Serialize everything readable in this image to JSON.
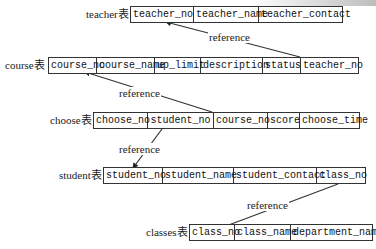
{
  "tables": [
    {
      "name": "teacher",
      "label": "teacher表",
      "columns": [
        "teacher_no",
        "teacher_name",
        "teacher_contact"
      ],
      "widths": [
        63,
        65,
        83
      ]
    },
    {
      "name": "course",
      "label": "course表",
      "columns": [
        "course_no",
        "course_name",
        "up_limit",
        "description",
        "status",
        "teacher_no"
      ],
      "widths": [
        48,
        58,
        46,
        62,
        38,
        57
      ]
    },
    {
      "name": "choose",
      "label": "choose表",
      "columns": [
        "choose_no",
        "student_no",
        "course_no",
        "score",
        "choose_time"
      ],
      "widths": [
        54,
        66,
        54,
        32,
        59
      ]
    },
    {
      "name": "student",
      "label": "student表",
      "columns": [
        "student_no",
        "student_name",
        "student_contact",
        "class_no"
      ],
      "widths": [
        59,
        71,
        83,
        48
      ]
    },
    {
      "name": "classes",
      "label": "classes表",
      "columns": [
        "class_no",
        "class_name",
        "department_name"
      ],
      "widths": [
        45,
        56,
        81
      ]
    }
  ],
  "references": [
    {
      "label": "reference",
      "from": "course.teacher_no",
      "to": "teacher.teacher_no"
    },
    {
      "label": "reference",
      "from": "choose.course_no",
      "to": "course.course_no"
    },
    {
      "label": "reference",
      "from": "choose.student_no",
      "to": "student.student_no"
    },
    {
      "label": "reference",
      "from": "student.class_no",
      "to": "classes.class_no"
    }
  ],
  "colors": {
    "line": "#333333",
    "text": "#111111",
    "background": "#ffffff"
  }
}
